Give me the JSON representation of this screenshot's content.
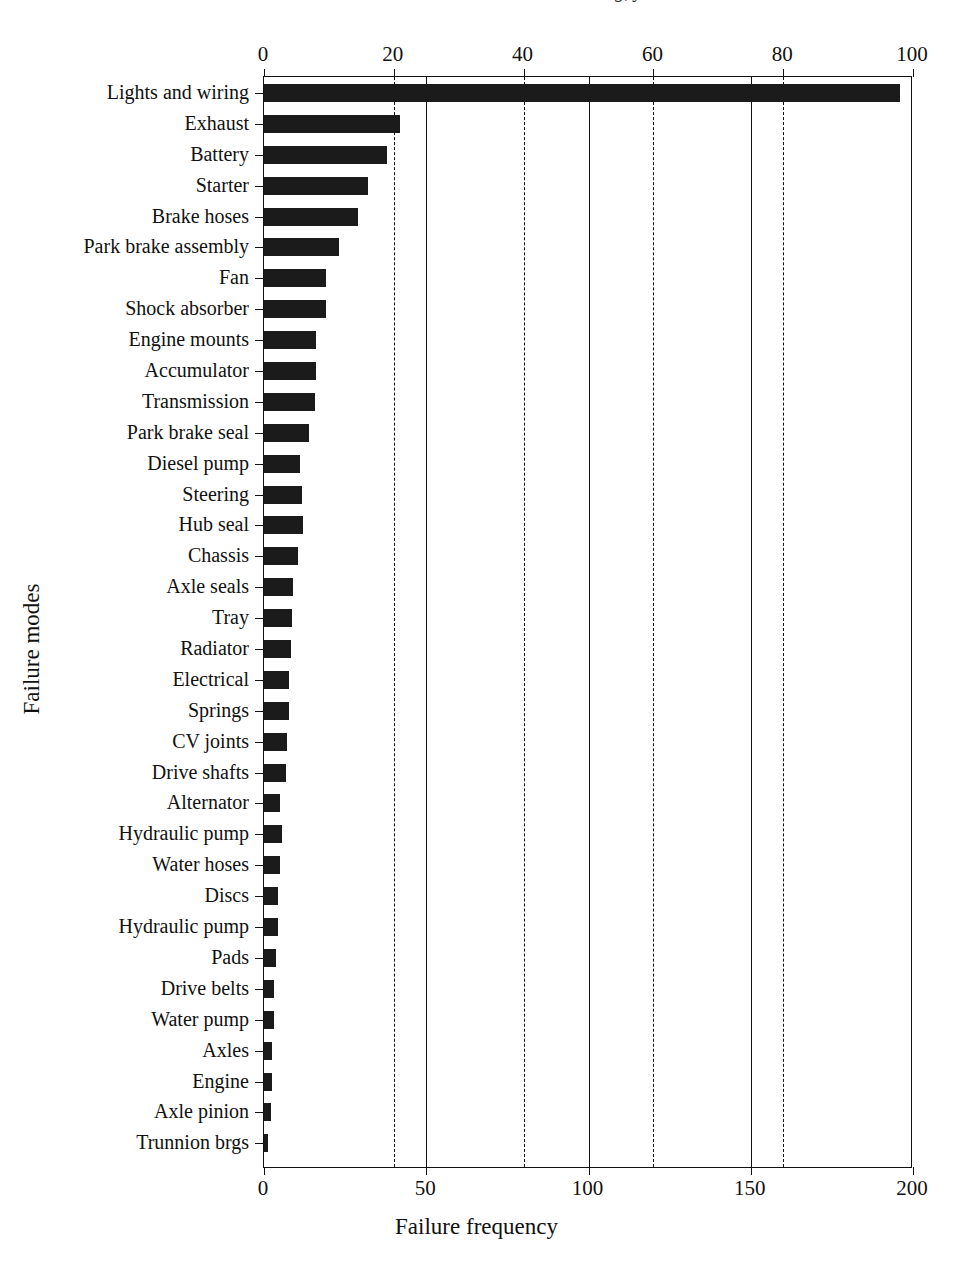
{
  "figure": {
    "cropped_caption_fragment": "g,           y",
    "x_axis_bottom": {
      "label": "Failure frequency",
      "ticks": [
        0,
        50,
        100,
        150,
        200
      ],
      "min": 0,
      "max": 200
    },
    "x_axis_top": {
      "ticks": [
        0,
        20,
        40,
        60,
        80,
        100
      ],
      "min": 0,
      "max": 100
    },
    "y_axis": {
      "label": "Failure modes"
    }
  },
  "chart_data": {
    "type": "bar",
    "orientation": "horizontal",
    "title": "",
    "xlabel": "Failure frequency",
    "ylabel": "Failure modes",
    "xlim": [
      0,
      200
    ],
    "secondary_xlim": [
      0,
      100
    ],
    "grid": true,
    "legend": "none",
    "categories": [
      "Lights and wiring",
      "Exhaust",
      "Battery",
      "Starter",
      "Brake hoses",
      "Park brake assembly",
      "Fan",
      "Shock absorber",
      "Engine mounts",
      "Accumulator",
      "Transmission",
      "Park brake seal",
      "Diesel pump",
      "Steering",
      "Hub seal",
      "Chassis",
      "Axle seals",
      "Tray",
      "Radiator",
      "Electrical",
      "Springs",
      "CV joints",
      "Drive shafts",
      "Alternator",
      "Hydraulic pump",
      "Water hoses",
      "Discs",
      "Hydraulic pump",
      "Pads",
      "Drive belts",
      "Water pump",
      "Axles",
      "Engine",
      "Axle pinion",
      "Trunnion brgs"
    ],
    "values": [
      98,
      21,
      19,
      16,
      14.5,
      11.5,
      9.5,
      9.5,
      8,
      8,
      7.8,
      7,
      5.5,
      5.8,
      6,
      5.2,
      4.5,
      4.3,
      4.2,
      3.9,
      3.8,
      3.6,
      3.4,
      2.5,
      2.8,
      2.4,
      2.1,
      2.1,
      1.8,
      1.5,
      1.5,
      1.2,
      1.2,
      1.1,
      0.6
    ],
    "value_units": "failure frequency (top scale 0-100)"
  }
}
